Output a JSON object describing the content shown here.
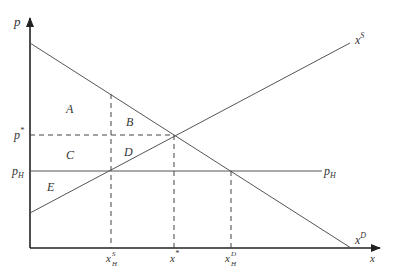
{
  "diagram": {
    "axes": {
      "y_label": "p",
      "x_label": "x"
    },
    "curves": {
      "supply_label": "x",
      "supply_sup": "S",
      "demand_label": "x",
      "demand_sup": "D",
      "price_floor_label": "p",
      "price_floor_sub": "H"
    },
    "y_ticks": {
      "equilibrium_price": "p",
      "equilibrium_price_sup": "*",
      "high_price": "p",
      "high_price_sub": "H"
    },
    "x_ticks": {
      "supply_quantity": "x",
      "supply_quantity_sup": "S",
      "supply_quantity_sub": "H",
      "equilibrium_quantity": "x",
      "equilibrium_quantity_sup": "*",
      "demand_quantity": "x",
      "demand_quantity_sup": "D",
      "demand_quantity_sub": "H"
    },
    "regions": {
      "A": "A",
      "B": "B",
      "C": "C",
      "D": "D",
      "E": "E"
    },
    "colors": {
      "axis": "#222222",
      "line": "#555555",
      "text": "#333333"
    }
  }
}
